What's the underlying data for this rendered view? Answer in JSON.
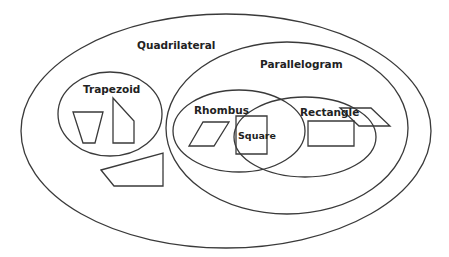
{
  "colors": {
    "stroke": "#3a3a3a",
    "text": "#222222",
    "background": "#ffffff"
  },
  "labels": {
    "quadrilateral": "Quadrilateral",
    "parallelogram": "Parallelogram",
    "trapezoid": "Trapezoid",
    "rhombus": "Rhombus",
    "rectangle": "Rectangle",
    "square": "Square"
  },
  "regions": [
    {
      "name": "Quadrilateral",
      "cx": 226,
      "cy": 131,
      "rx": 205,
      "ry": 117
    },
    {
      "name": "Parallelogram",
      "cx": 287,
      "cy": 128,
      "rx": 121,
      "ry": 86
    },
    {
      "name": "Trapezoid",
      "cx": 110,
      "cy": 114,
      "rx": 52,
      "ry": 42
    },
    {
      "name": "Rhombus",
      "cx": 239,
      "cy": 131,
      "rx": 66,
      "ry": 41
    },
    {
      "name": "Rectangle",
      "cx": 305,
      "cy": 137,
      "rx": 71,
      "ry": 40
    }
  ],
  "shapes": [
    {
      "name": "isosceles-trapezoid",
      "region": "Trapezoid",
      "points": "73,112 103,112 95,143 83,143"
    },
    {
      "name": "right-trapezoid",
      "region": "Trapezoid",
      "points": "113,98 134,121 134,143 113,143"
    },
    {
      "name": "irregular-quadrilateral",
      "region": "Quadrilateral",
      "points": "101,170 163,153 163,186 114,186"
    },
    {
      "name": "parallelogram",
      "region": "Parallelogram",
      "points": "340,108 371,108 390,126 359,126"
    },
    {
      "name": "rhombus",
      "region": "Rhombus",
      "points": "203,122 229,122 214,146 189,146"
    },
    {
      "name": "square",
      "region": "Square",
      "points": "236,116 267,116 267,154 236,154"
    },
    {
      "name": "rectangle",
      "region": "Rectangle",
      "points": "308,121 354,121 354,146 308,146"
    }
  ]
}
